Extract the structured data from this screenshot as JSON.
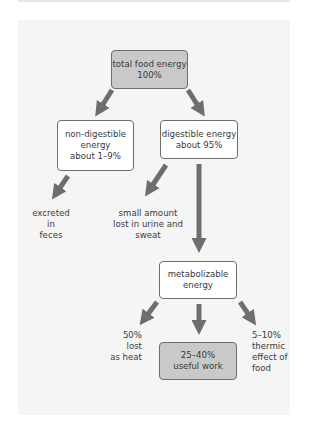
{
  "diagram": {
    "nodes": {
      "total": {
        "line1": "total food energy",
        "line2": "100%"
      },
      "nondigestible": {
        "line1": "non-digestible",
        "line2": "energy",
        "line3": "about 1–9%"
      },
      "digestible": {
        "line1": "digestible energy",
        "line2": "about 95%"
      },
      "metabolizable": {
        "line1": "metabolizable",
        "line2": "energy"
      },
      "useful": {
        "line1": "25–40%",
        "line2": "useful work"
      }
    },
    "outputs": {
      "feces": {
        "line1": "excreted in",
        "line2": "feces"
      },
      "urine": {
        "line1": "small amount",
        "line2": "lost in urine and sweat"
      },
      "heat": {
        "line1": "50% lost",
        "line2": "as heat"
      },
      "thermic": {
        "line1": "5–10%",
        "line2": "thermic",
        "line3": "effect of",
        "line4": "food"
      }
    },
    "colors": {
      "highlight_box": "#c9c9c9",
      "arrow": "#6e6e6e",
      "panel": "#f5f5f5"
    }
  }
}
